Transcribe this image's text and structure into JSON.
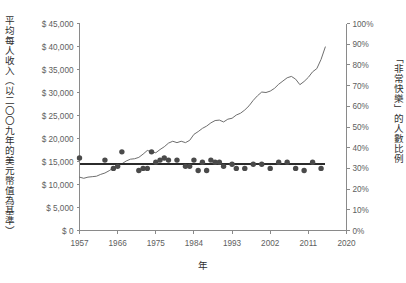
{
  "chart_data": {
    "type": "line",
    "title": "",
    "subtitle": "",
    "xlabel": "年",
    "ylabel_left": "平均每人收入（以二〇〇九年的美元幣值為基準）",
    "ylabel_right": "「非常快樂」的人數比例",
    "xlim": [
      1957,
      2020
    ],
    "ylim_left": [
      0,
      45000
    ],
    "ylim_right": [
      0,
      100
    ],
    "grid": false,
    "legend_position": "none",
    "x_ticks": [
      1957,
      1966,
      1975,
      1984,
      1993,
      2002,
      2011,
      2020
    ],
    "x_tick_labels": [
      "1957",
      "1966",
      "1975",
      "1984",
      "1993",
      "2002",
      "2011",
      "2020"
    ],
    "y_ticks_left": [
      0,
      5000,
      10000,
      15000,
      20000,
      25000,
      30000,
      35000,
      40000,
      45000
    ],
    "y_tick_labels_left": [
      "$ 0",
      "$ 5,000",
      "$ 10,000",
      "$ 15,000",
      "$ 20,000",
      "$ 25,000",
      "$ 30,000",
      "$ 35,000",
      "$ 40,000",
      "$ 45,000"
    ],
    "y_ticks_right": [
      0,
      10,
      20,
      30,
      40,
      50,
      60,
      70,
      80,
      90,
      100
    ],
    "y_tick_labels_right": [
      "0%",
      "10%",
      "20%",
      "30%",
      "40%",
      "50%",
      "60%",
      "70%",
      "80%",
      "90%",
      "100%"
    ],
    "series": [
      {
        "name": "平均每人收入",
        "type": "line",
        "axis": "left",
        "color": "#6e6e6e",
        "x": [
          1957,
          1958,
          1959,
          1960,
          1961,
          1962,
          1963,
          1964,
          1965,
          1966,
          1967,
          1968,
          1969,
          1970,
          1971,
          1972,
          1973,
          1974,
          1975,
          1976,
          1977,
          1978,
          1979,
          1980,
          1981,
          1982,
          1983,
          1984,
          1985,
          1986,
          1987,
          1988,
          1989,
          1990,
          1991,
          1992,
          1993,
          1994,
          1995,
          1996,
          1997,
          1998,
          1999,
          2000,
          2001,
          2002,
          2003,
          2004,
          2005,
          2006,
          2007,
          2008,
          2009,
          2010,
          2011,
          2012,
          2013,
          2014,
          2015
        ],
        "y": [
          11600,
          11350,
          11600,
          11700,
          11800,
          12200,
          12500,
          13000,
          13600,
          14200,
          14500,
          15100,
          15500,
          15600,
          15900,
          16600,
          17400,
          17100,
          16900,
          17600,
          18200,
          19000,
          19400,
          19100,
          19400,
          19100,
          19600,
          20900,
          21500,
          22200,
          22700,
          23400,
          23900,
          24000,
          23600,
          24200,
          24400,
          25100,
          25500,
          26200,
          27100,
          28300,
          29300,
          30100,
          30000,
          30300,
          30900,
          31800,
          32500,
          33200,
          33500,
          32900,
          31700,
          32400,
          33300,
          34500,
          35200,
          37200,
          39900
        ]
      },
      {
        "name": "「非常快樂」的人數比例",
        "type": "scatter",
        "axis": "right",
        "color": "#4a4a4a",
        "x": [
          1957,
          1963,
          1965,
          1966,
          1967,
          1971,
          1972,
          1973,
          1974,
          1975,
          1976,
          1977,
          1978,
          1980,
          1982,
          1983,
          1984,
          1985,
          1986,
          1987,
          1988,
          1989,
          1990,
          1991,
          1993,
          1994,
          1996,
          1998,
          2000,
          2002,
          2004,
          2006,
          2008,
          2010,
          2012,
          2014
        ],
        "y": [
          35,
          34,
          30,
          31,
          38,
          29,
          30,
          30,
          38,
          33,
          34,
          35,
          34,
          34,
          31,
          31,
          34,
          29,
          33,
          29,
          34,
          33,
          33,
          31,
          32,
          30,
          30,
          32,
          32,
          30,
          33,
          33,
          30,
          29,
          33,
          30
        ]
      },
      {
        "name": "快樂比例趨勢線",
        "type": "line",
        "axis": "right",
        "color": "#2b2b2b",
        "x": [
          1957,
          2015
        ],
        "y": [
          32,
          32
        ]
      }
    ]
  }
}
